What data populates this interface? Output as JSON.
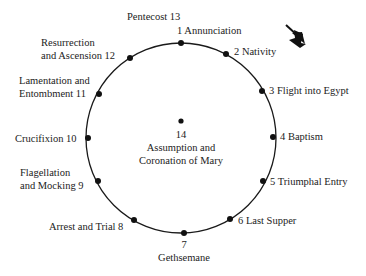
{
  "diagram": {
    "direction_indicator": "clockwise-arrow-icon",
    "circle": {
      "cx": 181,
      "cy": 138,
      "r": 95,
      "stroke": "#1a1a1a"
    },
    "nodes": [
      {
        "number": "1",
        "name": "Annunciation",
        "label": "1 Annunciation",
        "x": 181,
        "y": 43
      },
      {
        "number": "2",
        "name": "Nativity",
        "label": "2 Nativity",
        "x": 226,
        "y": 54
      },
      {
        "number": "3",
        "name": "Flight into Egypt",
        "label": "3 Flight into Egypt",
        "x": 262,
        "y": 91
      },
      {
        "number": "4",
        "name": "Baptism",
        "label": "4 Baptism",
        "x": 273,
        "y": 137
      },
      {
        "number": "5",
        "name": "Triumphal Entry",
        "label": "5 Triumphal Entry",
        "x": 263,
        "y": 181
      },
      {
        "number": "6",
        "name": "Last Supper",
        "label": "6 Last Supper",
        "x": 230,
        "y": 219
      },
      {
        "number": "7",
        "name": "Gethsemane",
        "label_line1": "7",
        "label_line2": "Gethsemane",
        "x": 184,
        "y": 233
      },
      {
        "number": "8",
        "name": "Arrest and Trial",
        "label": "Arrest and Trial 8",
        "x": 134,
        "y": 220
      },
      {
        "number": "9",
        "name": "Flagellation and Mocking",
        "label_line1": "Flagellation",
        "label_line2": "and Mocking 9",
        "x": 98,
        "y": 181
      },
      {
        "number": "10",
        "name": "Crucifixion",
        "label": "Crucifixion 10",
        "x": 88,
        "y": 138
      },
      {
        "number": "11",
        "name": "Lamentation and Entombment",
        "label_line1": "Lamentation and",
        "label_line2": "Entombment 11",
        "x": 99,
        "y": 94
      },
      {
        "number": "12",
        "name": "Resurrection and Ascension",
        "label_line1": "Resurrection",
        "label_line2": "and Ascension 12",
        "x": 130,
        "y": 58
      },
      {
        "number": "13",
        "name": "Pentecost",
        "label": "Pentecost 13"
      }
    ],
    "center": {
      "number": "14",
      "label_line1": "Assumption and",
      "label_line2": "Coronation of Mary",
      "x": 181,
      "y": 121
    }
  }
}
